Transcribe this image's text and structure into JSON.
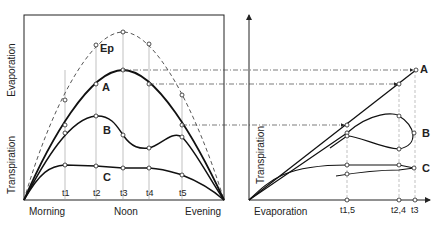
{
  "left_panel": {
    "y_axis_top": "Evaporation",
    "y_axis_bottom": "Transpiration",
    "x_labels": [
      "Morning",
      "Noon",
      "Evening"
    ],
    "time_marks": [
      "t1",
      "t2",
      "t3",
      "t4",
      "t5"
    ],
    "curves": [
      "Ep",
      "A",
      "B",
      "C"
    ],
    "point_numbers": [
      "1",
      "2",
      "3",
      "4",
      "5"
    ]
  },
  "right_panel": {
    "y_axis": "Transpiration",
    "x_axis": "Evaporation",
    "time_marks": [
      "t1,5",
      "t2,4",
      "t3"
    ],
    "curves": [
      "A",
      "B",
      "C"
    ],
    "point_numbers": [
      "1",
      "2",
      "3",
      "4",
      "5"
    ]
  }
}
